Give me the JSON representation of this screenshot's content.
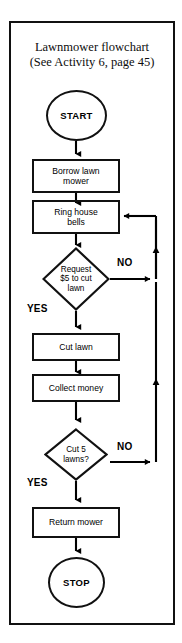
{
  "figure": {
    "title_line1": "Lawnmower flowchart",
    "title_line2": "(See Activity 6, page 45)",
    "frame_color": "#111111",
    "ink_color": "#000000",
    "background": "#ffffff"
  },
  "diagram": {
    "type": "flowchart",
    "orientation": "top-to-bottom",
    "nodes": [
      {
        "id": "start",
        "shape": "oval",
        "label": "START"
      },
      {
        "id": "borrow",
        "shape": "process",
        "label_line1": "Borrow lawn",
        "label_line2": "mower"
      },
      {
        "id": "ring",
        "shape": "process",
        "label_line1": "Ring house",
        "label_line2": "bells"
      },
      {
        "id": "request",
        "shape": "decision",
        "label_line1": "Request",
        "label_line2": "$5 to cut",
        "label_line3": "lawn"
      },
      {
        "id": "cut",
        "shape": "process",
        "label_line1": "Cut lawn"
      },
      {
        "id": "collect",
        "shape": "process",
        "label_line1": "Collect money"
      },
      {
        "id": "cut5",
        "shape": "decision",
        "label_line1": "Cut 5",
        "label_line2": "lawns?"
      },
      {
        "id": "return",
        "shape": "process",
        "label_line1": "Return mower"
      },
      {
        "id": "stop",
        "shape": "oval",
        "label": "STOP"
      }
    ],
    "branch_labels": {
      "request_no": "NO",
      "request_yes": "YES",
      "cut5_no": "NO",
      "cut5_yes": "YES"
    },
    "edges": [
      {
        "from": "start",
        "to": "borrow",
        "label": ""
      },
      {
        "from": "borrow",
        "to": "ring",
        "label": ""
      },
      {
        "from": "ring",
        "to": "request",
        "label": ""
      },
      {
        "from": "request",
        "to": "cut",
        "label": "YES"
      },
      {
        "from": "request",
        "to": "ring",
        "label": "NO"
      },
      {
        "from": "cut",
        "to": "collect",
        "label": ""
      },
      {
        "from": "collect",
        "to": "cut5",
        "label": ""
      },
      {
        "from": "cut5",
        "to": "return",
        "label": "YES"
      },
      {
        "from": "cut5",
        "to": "ring",
        "label": "NO"
      },
      {
        "from": "return",
        "to": "stop",
        "label": ""
      }
    ]
  }
}
